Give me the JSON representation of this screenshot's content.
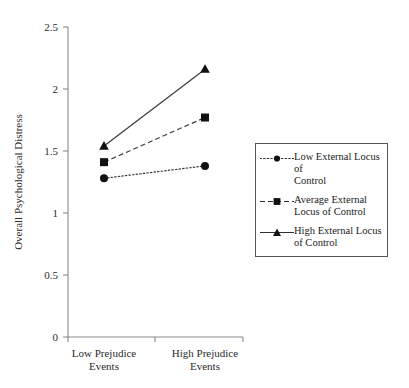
{
  "chart_data": {
    "type": "line",
    "title": "",
    "xlabel": "",
    "ylabel": "Overall Psychological Distress",
    "categories": [
      "Low Prejudice\nEvents",
      "High Prejudice\nEvents"
    ],
    "category_labels_flat": [
      "Low Prejudice Events",
      "High Prejudice Events"
    ],
    "ylim": [
      0,
      2.5
    ],
    "yticks": [
      0,
      0.5,
      1,
      1.5,
      2,
      2.5
    ],
    "ytick_labels": [
      "0",
      "0.5",
      "1",
      "1.5",
      "2",
      "2.5"
    ],
    "grid": false,
    "legend_position": "right",
    "series": [
      {
        "name": "Low External Locus of Control",
        "legend_label": "Low External Locus of\nControl",
        "values": [
          1.28,
          1.38
        ],
        "marker": "circle",
        "linestyle": "dotted",
        "color": "#111111"
      },
      {
        "name": "Average External Locus of Control",
        "legend_label": "Average External\nLocus of Control",
        "values": [
          1.41,
          1.77
        ],
        "marker": "square",
        "linestyle": "dashed",
        "color": "#111111"
      },
      {
        "name": "High External Locus of Control",
        "legend_label": "High External Locus\nof Control",
        "values": [
          1.54,
          2.16
        ],
        "marker": "triangle",
        "linestyle": "solid",
        "color": "#111111"
      }
    ]
  },
  "axes": {
    "y_title": "Overall Psychological Distress",
    "y_tick_0": "0",
    "y_tick_1": "0.5",
    "y_tick_2": "1",
    "y_tick_3": "1.5",
    "y_tick_4": "2",
    "y_tick_5": "2.5",
    "x_cat_0_line1": "Low Prejudice",
    "x_cat_0_line2": "Events",
    "x_cat_1_line1": "High Prejudice",
    "x_cat_1_line2": "Events"
  },
  "legend": {
    "items": [
      {
        "label_line1": "Low External Locus of",
        "label_line2": "Control",
        "marker": "circle-marker",
        "line": "dotted-line"
      },
      {
        "label_line1": "Average External",
        "label_line2": "Locus of Control",
        "marker": "square-marker",
        "line": "dashed-line"
      },
      {
        "label_line1": "High External Locus",
        "label_line2": "of Control",
        "marker": "triangle-marker",
        "line": "solid-line"
      }
    ]
  },
  "colors": {
    "background": "#ffffff",
    "axis": "#8a8a8a",
    "ink": "#111111",
    "legend_border": "#555555"
  }
}
